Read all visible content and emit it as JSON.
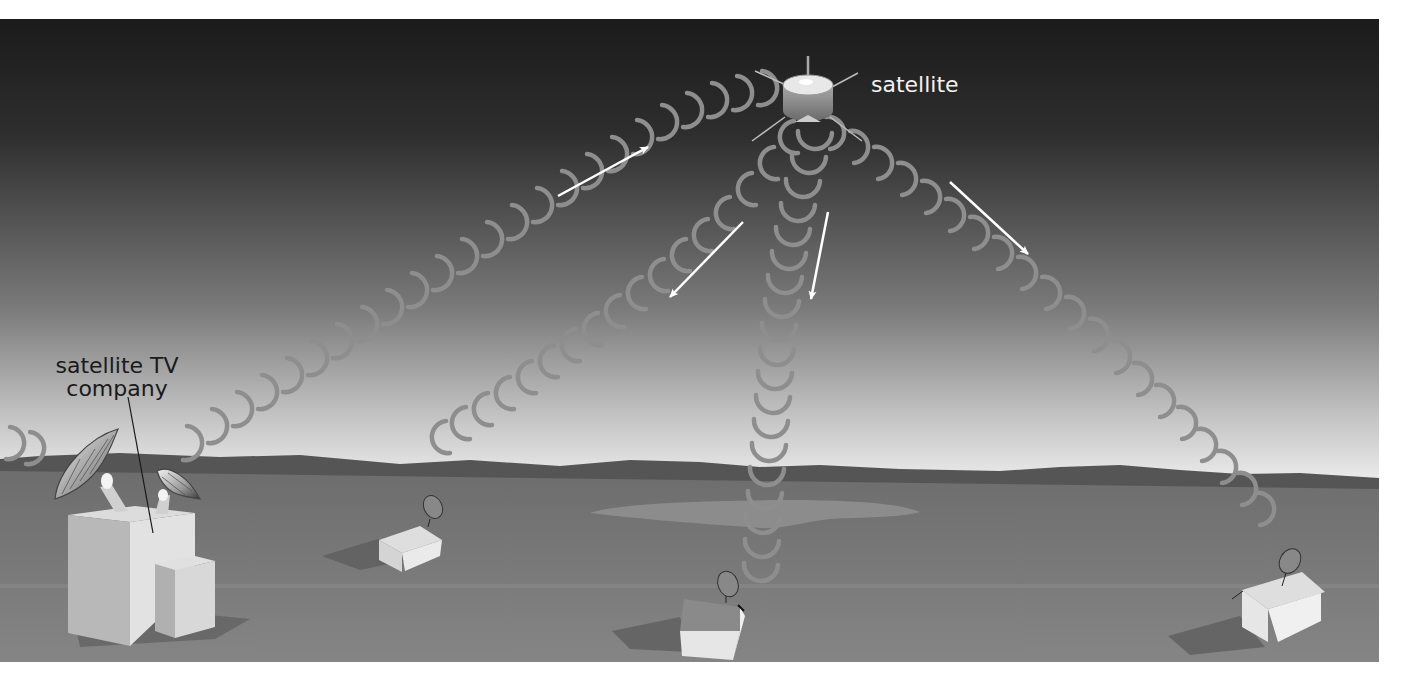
{
  "diagram": {
    "labels": {
      "satellite": "satellite",
      "company_line1": "satellite TV",
      "company_line2": "company"
    },
    "elements": {
      "satellite": {
        "icon": "satellite-icon"
      },
      "uplink_station": {
        "icon": "dish-antenna-icon",
        "dish_count": 2
      },
      "houses": [
        {
          "id": "house-left",
          "icon": "house-with-dish-icon"
        },
        {
          "id": "house-center",
          "icon": "house-with-dish-icon"
        },
        {
          "id": "house-right",
          "icon": "house-with-dish-icon"
        }
      ],
      "signal_paths": [
        {
          "id": "uplink",
          "from": "satellite TV company",
          "to": "satellite",
          "direction": "up"
        },
        {
          "id": "downlink-left",
          "from": "satellite",
          "to": "house-left",
          "direction": "down"
        },
        {
          "id": "downlink-center",
          "from": "satellite",
          "to": "house-center",
          "direction": "down"
        },
        {
          "id": "downlink-right",
          "from": "satellite",
          "to": "house-right",
          "direction": "down"
        }
      ]
    },
    "colors": {
      "sky_top": "#1b1b1b",
      "sky_bottom": "#ececec",
      "ground": "#777777",
      "horizon_hills": "#555555",
      "lake": "#8c8c8c",
      "wave": "#8e8e8e",
      "arrow": "#ffffff"
    }
  }
}
